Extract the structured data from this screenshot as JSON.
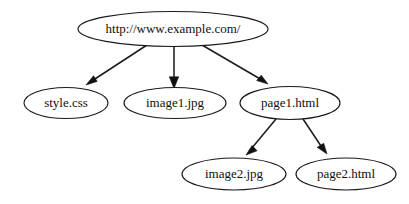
{
  "diagram": {
    "type": "directed-graph",
    "background_color": "#ffffff",
    "node_fill_color": "#ffffff",
    "node_stroke_color": "#1a1a1a",
    "edge_color": "#1a1a1a",
    "label_color": "#111111",
    "nodes": [
      {
        "id": "root",
        "label": "http://www.example.com/",
        "cx": 173,
        "cy": 29,
        "rx": 95,
        "ry": 17.5,
        "font_size": 13
      },
      {
        "id": "style",
        "label": "style.css",
        "cx": 66,
        "cy": 103,
        "rx": 42,
        "ry": 15.5,
        "font_size": 13
      },
      {
        "id": "image1",
        "label": "image1.jpg",
        "cx": 175,
        "cy": 103,
        "rx": 51,
        "ry": 15.5,
        "font_size": 13
      },
      {
        "id": "page1",
        "label": "page1.html",
        "cx": 290,
        "cy": 103,
        "rx": 50,
        "ry": 16.5,
        "font_size": 13
      },
      {
        "id": "image2",
        "label": "image2.jpg",
        "cx": 234,
        "cy": 174,
        "rx": 52,
        "ry": 16,
        "font_size": 13
      },
      {
        "id": "page2",
        "label": "page2.html",
        "cx": 346,
        "cy": 174,
        "rx": 50,
        "ry": 16,
        "font_size": 13
      }
    ],
    "edges": [
      {
        "id": "root-to-style",
        "from": "root",
        "to": "style",
        "from_label": "http://www.example.com/",
        "to_label": "style.css",
        "x1": 147,
        "y1": 45,
        "x2": 86,
        "y2": 85,
        "angle_deg": 147
      },
      {
        "id": "root-to-image1",
        "from": "root",
        "to": "image1",
        "from_label": "http://www.example.com/",
        "to_label": "image1.jpg",
        "x1": 174,
        "y1": 46,
        "x2": 174,
        "y2": 86,
        "angle_deg": 90
      },
      {
        "id": "root-to-page1",
        "from": "root",
        "to": "page1",
        "from_label": "http://www.example.com/",
        "to_label": "page1.html",
        "x1": 202,
        "y1": 45,
        "x2": 268,
        "y2": 84,
        "angle_deg": 31
      },
      {
        "id": "page1-to-image2",
        "from": "page1",
        "to": "image2",
        "from_label": "page1.html",
        "to_label": "image2.jpg",
        "x1": 276,
        "y1": 119,
        "x2": 246,
        "y2": 155,
        "angle_deg": 130
      },
      {
        "id": "page1-to-page2",
        "from": "page1",
        "to": "page2",
        "from_label": "page1.html",
        "to_label": "page2.html",
        "x1": 303,
        "y1": 119,
        "x2": 327,
        "y2": 154,
        "angle_deg": 56
      }
    ]
  }
}
